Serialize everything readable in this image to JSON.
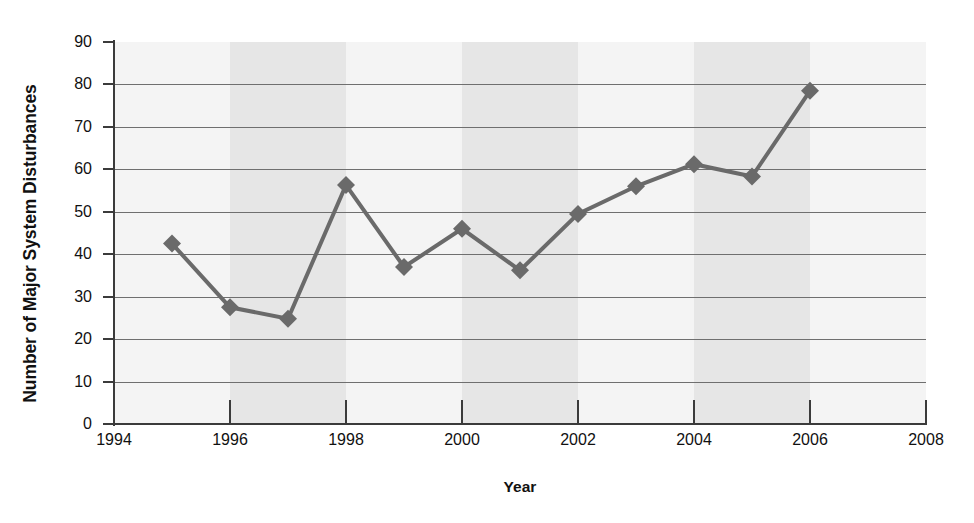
{
  "chart_data": {
    "type": "line",
    "title": "",
    "subtitle": "",
    "xlabel": "Year",
    "ylabel": "Number of Major System Disturbances",
    "xlim": [
      1994,
      2008
    ],
    "ylim": [
      0,
      90
    ],
    "x_ticks": [
      1994,
      1996,
      1998,
      2000,
      2002,
      2004,
      2006,
      2008
    ],
    "x_tick_labels": [
      "1994",
      "1996",
      "1998",
      "2000",
      "2002",
      "2004",
      "2006",
      "2008"
    ],
    "y_ticks": [
      0,
      10,
      20,
      30,
      40,
      50,
      60,
      70,
      80,
      90
    ],
    "y_tick_labels": [
      "0",
      "10",
      "20",
      "30",
      "40",
      "50",
      "60",
      "70",
      "80",
      "90"
    ],
    "grid": "horizontal",
    "legend": "none",
    "marker": "diamond",
    "series_color": "#6a6a6a",
    "plot_background": "#f2f2f2",
    "band_color": "#e6e6e6",
    "gridline_color": "#6f6f6f",
    "axis_color": "#3b3b3b",
    "x": [
      1995,
      1996,
      1997,
      1998,
      1999,
      2000,
      2001,
      2002,
      2003,
      2004,
      2005,
      2006
    ],
    "values": [
      42.5,
      27.5,
      24.8,
      56.3,
      37.0,
      46.0,
      36.2,
      49.5,
      56.0,
      61.2,
      58.3,
      78.5
    ],
    "series": [
      {
        "name": "Major System Disturbances",
        "values": [
          42.5,
          27.5,
          24.8,
          56.3,
          37.0,
          46.0,
          36.2,
          49.5,
          56.0,
          61.2,
          58.3,
          78.5
        ]
      }
    ],
    "points": [
      {
        "year": "1995",
        "value": 42.5
      },
      {
        "year": "1996",
        "value": 27.5
      },
      {
        "year": "1997",
        "value": 24.8
      },
      {
        "year": "1998",
        "value": 56.3
      },
      {
        "year": "1999",
        "value": 37.0
      },
      {
        "year": "2000",
        "value": 46.0
      },
      {
        "year": "2001",
        "value": 36.2
      },
      {
        "year": "2002",
        "value": 49.5
      },
      {
        "year": "2003",
        "value": 56.0
      },
      {
        "year": "2004",
        "value": 61.2
      },
      {
        "year": "2005",
        "value": 58.3
      },
      {
        "year": "2006",
        "value": 78.5
      }
    ]
  }
}
